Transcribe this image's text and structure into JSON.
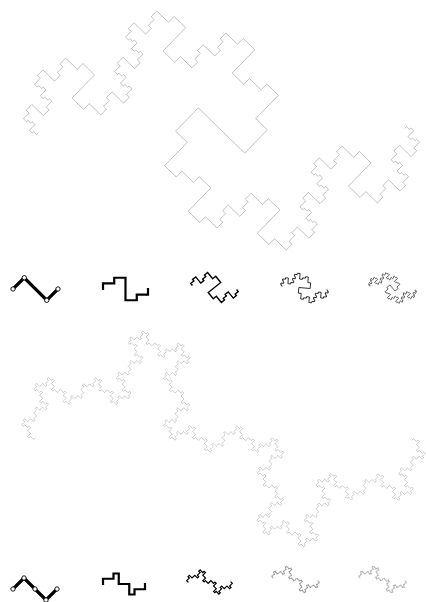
{
  "figure": {
    "width": 426,
    "height": 602,
    "background": "#ffffff",
    "curve_color": "#000000",
    "panels": [
      {
        "id": "top",
        "name": "curve-a",
        "generator": [
          [
            0,
            0
          ],
          [
            1,
            -1
          ],
          [
            3,
            1
          ],
          [
            4,
            0
          ]
        ],
        "main": {
          "start": [
            38,
            133
          ],
          "end": [
            405,
            128
          ],
          "depth": 5,
          "stroke_width": 0.45,
          "opacity": 0.55
        },
        "thumbnails": [
          {
            "start": [
              13,
              289
            ],
            "end": [
              58,
              289
            ],
            "depth": 1,
            "stroke_width": 3.2,
            "opacity": 1.0,
            "show_nodes": true
          },
          {
            "start": [
              103,
              289
            ],
            "end": [
              148,
              289
            ],
            "depth": 2,
            "stroke_width": 2.2,
            "opacity": 1.0,
            "show_nodes": false
          },
          {
            "start": [
              192,
              285
            ],
            "end": [
              237,
              290
            ],
            "depth": 3,
            "stroke_width": 1.4,
            "opacity": 1.0,
            "show_nodes": false
          },
          {
            "start": [
              282,
              286
            ],
            "end": [
              327,
              290
            ],
            "depth": 4,
            "stroke_width": 0.9,
            "opacity": 0.9,
            "show_nodes": false
          },
          {
            "start": [
              370,
              286
            ],
            "end": [
              415,
              290
            ],
            "depth": 5,
            "stroke_width": 0.7,
            "opacity": 0.85,
            "show_nodes": false
          }
        ]
      },
      {
        "id": "bottom",
        "name": "curve-b",
        "generator": [
          [
            0,
            0
          ],
          [
            1,
            -1
          ],
          [
            2,
            0
          ],
          [
            3,
            1
          ],
          [
            4,
            0
          ]
        ],
        "main": {
          "start": [
            35,
            438
          ],
          "end": [
            412,
            440
          ],
          "depth": 5,
          "stroke_width": 0.4,
          "opacity": 0.5
        },
        "thumbnails": [
          {
            "start": [
              13,
              589
            ],
            "end": [
              57,
              589
            ],
            "depth": 1,
            "stroke_width": 3.2,
            "opacity": 1.0,
            "show_nodes": true
          },
          {
            "start": [
              103,
              584
            ],
            "end": [
              145,
              584
            ],
            "depth": 2,
            "stroke_width": 2.2,
            "opacity": 1.0,
            "show_nodes": false
          },
          {
            "start": [
              188,
              582
            ],
            "end": [
              231,
              582
            ],
            "depth": 3,
            "stroke_width": 1.2,
            "opacity": 1.0,
            "show_nodes": false
          },
          {
            "start": [
              273,
              578
            ],
            "end": [
              318,
              581
            ],
            "depth": 4,
            "stroke_width": 0.6,
            "opacity": 0.5,
            "show_nodes": false
          },
          {
            "start": [
              360,
              578
            ],
            "end": [
              405,
              581
            ],
            "depth": 5,
            "stroke_width": 0.5,
            "opacity": 0.45,
            "show_nodes": false
          }
        ]
      }
    ]
  }
}
